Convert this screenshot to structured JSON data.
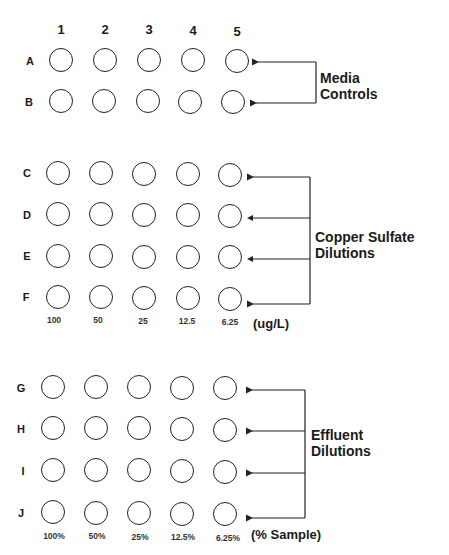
{
  "columns": [
    "1",
    "2",
    "3",
    "4",
    "5"
  ],
  "groups": [
    {
      "id": "media-controls",
      "label_line1": "Media",
      "label_line2": "Controls",
      "rows": [
        "A",
        "B"
      ],
      "concentrations": [],
      "unit": ""
    },
    {
      "id": "copper-sulfate",
      "label_line1": "Copper Sulfate",
      "label_line2": "Dilutions",
      "rows": [
        "C",
        "D",
        "E",
        "F"
      ],
      "concentrations": [
        "100",
        "50",
        "25",
        "12.5",
        "6.25"
      ],
      "unit": "(ug/L)"
    },
    {
      "id": "effluent",
      "label_line1": "Effluent",
      "label_line2": "Dilutions",
      "rows": [
        "G",
        "H",
        "I",
        "J"
      ],
      "concentrations": [
        "100%",
        "50%",
        "25%",
        "12.5%",
        "6.25%"
      ],
      "unit": "(% Sample)"
    }
  ],
  "colors": {
    "stroke": "#222222",
    "background": "#ffffff"
  }
}
